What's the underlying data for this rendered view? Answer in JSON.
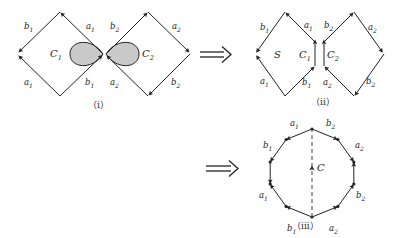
{
  "figure": {
    "caption_i": "（i）",
    "caption_ii": "（ii）",
    "caption_iii": "（iii）",
    "implies_symbol_1": "⟹",
    "implies_symbol_2": "⟹",
    "stroke_color": "#222222",
    "fill_color": "#c9c9c9",
    "background": "#ffffff"
  },
  "panel_i": {
    "left_diamond": {
      "region_label": "C1",
      "region_label_display": "C",
      "region_sub": "1",
      "edges": [
        {
          "name": "b1-top-left",
          "label": "b",
          "sub": "1"
        },
        {
          "name": "a1-top-right",
          "label": "a",
          "sub": "1"
        },
        {
          "name": "a1-bottom-left",
          "label": "a",
          "sub": "1"
        },
        {
          "name": "b1-bottom-right",
          "label": "b",
          "sub": "1"
        }
      ]
    },
    "right_diamond": {
      "region_label": "C2",
      "region_label_display": "C",
      "region_sub": "2",
      "edges": [
        {
          "name": "b2-top-left",
          "label": "b",
          "sub": "2"
        },
        {
          "name": "a2-top-right",
          "label": "a",
          "sub": "2"
        },
        {
          "name": "a2-bottom-left",
          "label": "a",
          "sub": "2"
        },
        {
          "name": "b2-bottom-right",
          "label": "b",
          "sub": "2"
        }
      ]
    }
  },
  "panel_ii": {
    "left_shape": {
      "surface_label": "S",
      "curve_label_display": "C",
      "curve_sub": "1",
      "edges": [
        {
          "name": "b1-top-left",
          "label": "b",
          "sub": "1"
        },
        {
          "name": "a1-top-right",
          "label": "a",
          "sub": "1"
        },
        {
          "name": "a1-bottom-left",
          "label": "a",
          "sub": "1"
        },
        {
          "name": "b1-bottom-right",
          "label": "b",
          "sub": "1"
        }
      ]
    },
    "right_shape": {
      "curve_label_display": "C",
      "curve_sub": "2",
      "edges": [
        {
          "name": "b2-top-left",
          "label": "b",
          "sub": "2"
        },
        {
          "name": "a2-top-right",
          "label": "a",
          "sub": "2"
        },
        {
          "name": "a2-bottom-left",
          "label": "a",
          "sub": "2"
        },
        {
          "name": "b2-bottom-right",
          "label": "b",
          "sub": "2"
        }
      ]
    }
  },
  "panel_iii": {
    "center_curve_label": "C",
    "polygon_sides": 10,
    "edges": [
      {
        "name": "a1-top-left",
        "label": "a",
        "sub": "1"
      },
      {
        "name": "b2-top-right",
        "label": "b",
        "sub": "2"
      },
      {
        "name": "b1-upper-left",
        "label": "b",
        "sub": "1"
      },
      {
        "name": "a2-upper-right",
        "label": "a",
        "sub": "2"
      },
      {
        "name": "a1-lower-left",
        "label": "a",
        "sub": "1"
      },
      {
        "name": "b2-lower-right",
        "label": "b",
        "sub": "2"
      },
      {
        "name": "b1-bottom-left",
        "label": "b",
        "sub": "1"
      },
      {
        "name": "a2-bottom-right",
        "label": "a",
        "sub": "2"
      }
    ]
  }
}
